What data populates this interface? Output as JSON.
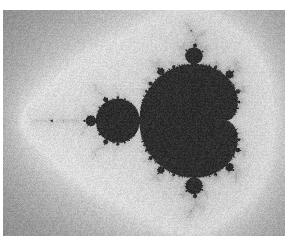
{
  "figure": {
    "title": "Mandelbrot Set",
    "kind": "fractal-raster-image",
    "alt_text": "Grayscale rendering of the Mandelbrot set",
    "render_style": "scanned halftone grayscale print with film grain"
  },
  "canvas": {
    "width": 291,
    "height": 244,
    "content_left": 3,
    "content_top": 10,
    "content_width": 282,
    "content_height": 226,
    "page_background": "#ffffff"
  },
  "palette": {
    "set_interior": "#2e2e2e",
    "boundary_dark": "#1a1a1a",
    "halo_white": "#ffffff",
    "far_background": "#a8a8a8",
    "background_min": "#9c9c9c",
    "background_max": "#c4c4c4",
    "grain_amplitude": 13
  },
  "chart_data": {
    "type": "heatmap",
    "title": "Mandelbrot Set",
    "xlabel": "Re(c)",
    "ylabel": "Im(c)",
    "complex_plane": {
      "re_min": -2.32,
      "re_max": 0.92,
      "im_min": -1.32,
      "im_max": 1.27
    },
    "max_iterations": 180,
    "escape_radius": 2.0,
    "coloring": "smooth escape-time, inverted grayscale: white halo near boundary fading to mid-gray far field, near-black inside the set",
    "features": [
      {
        "name": "main-cardioid",
        "period": 1,
        "center_re": -0.25,
        "center_im": 0.0,
        "pixel_center_x": 196,
        "pixel_center_y": 123,
        "pixel_radius": 56
      },
      {
        "name": "period-2-bulb",
        "period": 2,
        "center_re": -1.0,
        "center_im": 0.0,
        "pixel_center_x": 118,
        "pixel_center_y": 128,
        "pixel_radius": 26
      },
      {
        "name": "upper-period-3-bulb",
        "period": 3,
        "center_re": -0.125,
        "center_im": 0.744,
        "pixel_center_x": 204,
        "pixel_center_y": 53,
        "pixel_radius": 13
      },
      {
        "name": "lower-period-3-bulb",
        "period": 3,
        "center_re": -0.125,
        "center_im": -0.744,
        "pixel_center_x": 200,
        "pixel_center_y": 198,
        "pixel_radius": 13
      },
      {
        "name": "needle-antenna",
        "description": "real-axis spike extending toward c = -2",
        "pixel_start_x": 92,
        "pixel_end_x": 40,
        "pixel_y": 128
      }
    ]
  }
}
